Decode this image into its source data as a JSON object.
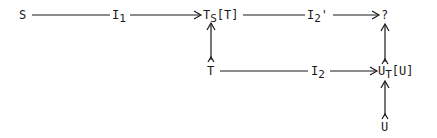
{
  "diagram": {
    "type": "commutative-diagram",
    "nodes": {
      "S": {
        "main": "S",
        "sub": "",
        "tail": ""
      },
      "I1": {
        "main": "I",
        "sub": "1",
        "tail": ""
      },
      "TsT": {
        "main": "T",
        "sub": "S",
        "tail": "[T]"
      },
      "I2p": {
        "main": "I",
        "sub": "2",
        "tail": "'"
      },
      "Q": {
        "main": "?",
        "sub": "",
        "tail": ""
      },
      "T": {
        "main": "T",
        "sub": "",
        "tail": ""
      },
      "I2": {
        "main": "I",
        "sub": "2",
        "tail": ""
      },
      "UtU": {
        "main": "U",
        "sub": "T",
        "tail": "[U]"
      },
      "U": {
        "main": "U",
        "sub": "",
        "tail": ""
      }
    },
    "edges": [
      {
        "from": "S",
        "to": "TsT",
        "label": "I1",
        "direction": "right"
      },
      {
        "from": "TsT",
        "to": "Q",
        "label": "I2'",
        "direction": "right"
      },
      {
        "from": "T",
        "to": "TsT",
        "label": "",
        "direction": "up"
      },
      {
        "from": "T",
        "to": "UtU",
        "label": "I2",
        "direction": "right"
      },
      {
        "from": "UtU",
        "to": "Q",
        "label": "",
        "direction": "up"
      },
      {
        "from": "U",
        "to": "UtU",
        "label": "",
        "direction": "up"
      }
    ],
    "line_color": "#1a1a1a"
  }
}
